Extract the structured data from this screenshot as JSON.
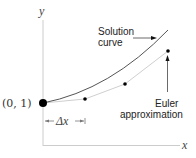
{
  "diagram": {
    "axes": {
      "x_label": "x",
      "y_label": "y"
    },
    "start_point": {
      "label": "(0, 1)"
    },
    "step": {
      "label": "Δx"
    },
    "solution_curve": {
      "label_line1": "Solution",
      "label_line2": "curve"
    },
    "euler": {
      "label_line1": "Euler",
      "label_line2": "approximation"
    },
    "colors": {
      "axis": "#cccccc",
      "solution_curve": "#555555",
      "euler_line": "#cfcfcf",
      "points": "#000000"
    }
  }
}
